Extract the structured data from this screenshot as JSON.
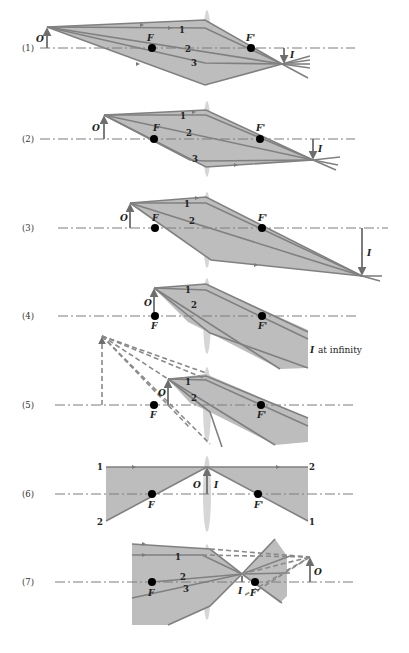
{
  "colors": {
    "fill": "#bdbdbd",
    "ray": "#808080",
    "lens": "#d6d6d6",
    "focal_dot": "#000000"
  },
  "labels": {
    "object": "O",
    "image": "I",
    "focal_front": "F",
    "focal_back": "F'",
    "image_at_infinity": "at infinity"
  },
  "rays": [
    "1",
    "2",
    "3"
  ],
  "diagrams": [
    {
      "id": "1",
      "label": "(1)",
      "rays": [
        "1",
        "2",
        "3"
      ]
    },
    {
      "id": "2",
      "label": "(2)",
      "rays": [
        "1",
        "2",
        "3"
      ]
    },
    {
      "id": "3",
      "label": "(3)",
      "rays": [
        "1",
        "2"
      ]
    },
    {
      "id": "4",
      "label": "(4)",
      "rays": [
        "1",
        "2"
      ],
      "note": "I at infinity"
    },
    {
      "id": "5",
      "label": "(5)",
      "rays": [
        "1",
        "2"
      ]
    },
    {
      "id": "6",
      "label": "(6)",
      "rays": [
        "1",
        "2",
        "2",
        "1"
      ]
    },
    {
      "id": "7",
      "label": "(7)",
      "rays": [
        "1",
        "2",
        "3"
      ]
    }
  ]
}
